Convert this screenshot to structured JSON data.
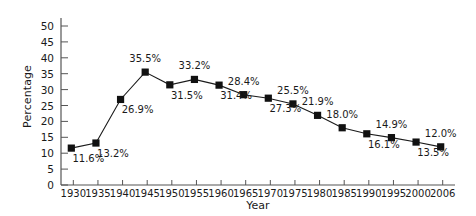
{
  "chart_data": {
    "type": "line",
    "title": "",
    "xlabel": "Year",
    "ylabel": "Percentage",
    "categories": [
      "1930",
      "1935",
      "1940",
      "1945",
      "1950",
      "1955",
      "1960",
      "1965",
      "1970",
      "1975",
      "1980",
      "1985",
      "1990",
      "1995",
      "2000",
      "2006"
    ],
    "values": [
      11.6,
      13.2,
      26.9,
      35.5,
      31.5,
      33.2,
      31.4,
      28.4,
      27.3,
      25.5,
      21.9,
      18.0,
      16.1,
      14.9,
      13.5,
      12.0
    ],
    "point_labels": [
      "11.6%",
      "13.2%",
      "26.9%",
      "35.5%",
      "31.5%",
      "33.2%",
      "31.4%",
      "28.4%",
      "27.3%",
      "25.5%",
      "21.9%",
      "18.0%",
      "16.1%",
      "14.9%",
      "13.5%",
      "12.0%"
    ],
    "label_placement": [
      "below",
      "below",
      "below",
      "above",
      "below",
      "above",
      "below",
      "above",
      "below",
      "above",
      "above",
      "above",
      "below",
      "above",
      "below",
      "above"
    ],
    "ylim": [
      0,
      50
    ],
    "ytick_values": [
      0,
      5,
      10,
      15,
      20,
      25,
      30,
      35,
      40,
      45,
      50
    ],
    "ytick_labels": [
      "0",
      "5",
      "10",
      "15",
      "20",
      "25",
      "30",
      "35",
      "40",
      "45",
      "50"
    ],
    "grid": false,
    "legend": "none",
    "marker": "square",
    "line_color": "#1a1a1a",
    "marker_color": "#111111",
    "axis_color": "#555555",
    "background": "#ffffff"
  }
}
